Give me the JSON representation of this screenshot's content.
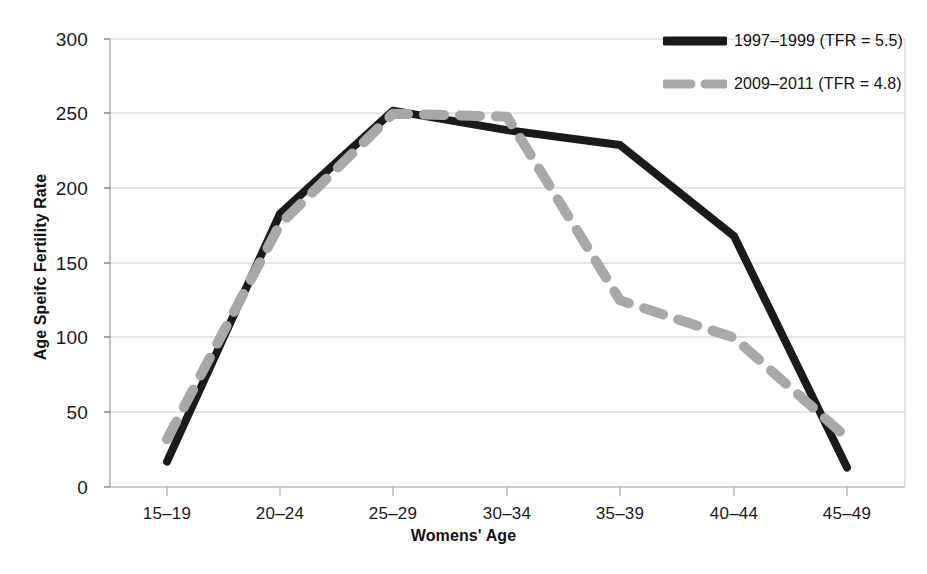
{
  "chart_data": {
    "type": "line",
    "title": "",
    "xlabel": "Womens' Age",
    "ylabel": "Age Speifc Fertility Rate",
    "categories": [
      "15–19",
      "20–24",
      "25–29",
      "30–34",
      "35–39",
      "40–44",
      "45–49"
    ],
    "series": [
      {
        "name": "1997–1999 (TFR = 5.5)",
        "period": "1997–1999",
        "tfr": "5.5",
        "color": "#1a1a1a",
        "style": "solid",
        "values": [
          17,
          183,
          252,
          239,
          229,
          168,
          13
        ]
      },
      {
        "name": "2009–2011 (TFR = 4.8)",
        "period": "2009–2011",
        "tfr": "4.8",
        "color": "#a8a8a8",
        "style": "dashed",
        "values": [
          32,
          176,
          250,
          248,
          125,
          100,
          33
        ]
      }
    ],
    "ylim": [
      0,
      300
    ],
    "ytick_values": [
      0,
      50,
      100,
      150,
      200,
      250,
      300
    ],
    "ytick_labels": [
      "0",
      "50",
      "100",
      "150",
      "200",
      "250",
      "300"
    ],
    "grid": "horizontal",
    "legend_position": "top-right"
  },
  "axes": {
    "y_ticks": [
      "300",
      "250",
      "200",
      "150",
      "100",
      "50",
      "0"
    ],
    "x_ticks": [
      "15–19",
      "20–24",
      "25–29",
      "30–34",
      "35–39",
      "40–44",
      "45–49"
    ],
    "y_title": "Age Speifc Fertility Rate",
    "x_title": "Womens' Age"
  },
  "legend": {
    "items": [
      {
        "label": "1997–1999 (TFR = 5.5)",
        "swatch": "solid-black-line-swatch"
      },
      {
        "label": "2009–2011 (TFR = 4.8)",
        "swatch": "dashed-gray-line-swatch"
      }
    ]
  },
  "colors": {
    "series_1": "#1a1a1a",
    "series_2": "#a8a8a8",
    "grid": "#c9c9c9",
    "axis": "#9a9a9a",
    "background": "#ffffff"
  }
}
